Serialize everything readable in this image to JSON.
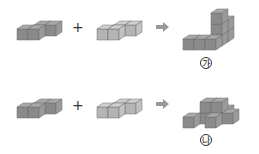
{
  "rows": [
    {
      "operator": "+",
      "result_label": "가",
      "result_label_circled": "㉮"
    },
    {
      "operator": "+",
      "result_label": "나",
      "result_label_circled": "㉯"
    }
  ],
  "colors": {
    "dark_front": "#8a8a8a",
    "dark_side": "#9a9a9a",
    "dark_top": "#a8a8a8",
    "light_front": "#b4b4b4",
    "light_side": "#c2c2c2",
    "light_top": "#cfcfcf",
    "edge": "#6e6e6e",
    "arrow": "#999999"
  },
  "figures": {
    "row1_piece_a": [
      [
        0,
        0,
        0
      ],
      [
        1,
        0,
        0
      ],
      [
        1,
        1,
        0
      ],
      [
        2,
        1,
        0
      ]
    ],
    "row1_piece_b": [
      [
        0,
        0,
        0
      ],
      [
        1,
        0,
        0
      ],
      [
        1,
        1,
        0
      ],
      [
        2,
        1,
        0
      ]
    ],
    "row1_result": [
      [
        0,
        0,
        0
      ],
      [
        1,
        0,
        0
      ],
      [
        2,
        0,
        0
      ],
      [
        2,
        1,
        0
      ],
      [
        2,
        1,
        1
      ],
      [
        2,
        1,
        2
      ],
      [
        2,
        2,
        0
      ],
      [
        2,
        2,
        1
      ]
    ],
    "row2_piece_a": [
      [
        0,
        0,
        0
      ],
      [
        1,
        0,
        0
      ],
      [
        1,
        1,
        0
      ],
      [
        2,
        1,
        0
      ]
    ],
    "row2_piece_b": [
      [
        0,
        0,
        0
      ],
      [
        1,
        0,
        0
      ],
      [
        1,
        1,
        0
      ],
      [
        2,
        1,
        0
      ]
    ],
    "row2_result": [
      [
        0,
        0,
        0
      ],
      [
        1,
        1,
        0
      ],
      [
        1,
        1,
        1
      ],
      [
        2,
        1,
        0
      ],
      [
        2,
        1,
        1
      ],
      [
        2,
        2,
        0
      ],
      [
        3,
        1,
        0
      ],
      [
        2,
        0,
        0
      ]
    ]
  }
}
